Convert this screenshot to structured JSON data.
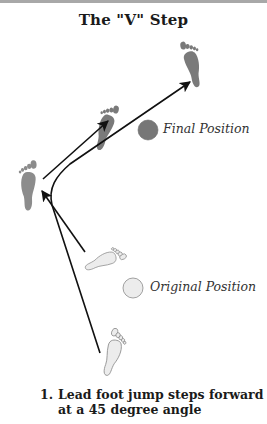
{
  "diagram": {
    "title": "The \"V\" Step",
    "legend": [
      {
        "label": "Final Position",
        "fill": "#777777",
        "stroke": "#6a6a6a"
      },
      {
        "label": "Original Position",
        "fill": "#ececec",
        "stroke": "#8a8a8a"
      }
    ],
    "footprints": [
      {
        "id": "final-right-foot",
        "state": "final",
        "fill": "#7a7a7a"
      },
      {
        "id": "final-lead-foot-middle",
        "state": "final",
        "fill": "#7a7a7a"
      },
      {
        "id": "final-left-foot",
        "state": "final",
        "fill": "#8a8a8a"
      },
      {
        "id": "original-left-foot",
        "state": "original",
        "fill": "#ececec"
      },
      {
        "id": "original-right-foot",
        "state": "original",
        "fill": "#ececec"
      }
    ],
    "arrow_color": "#111111",
    "caption": {
      "number": "1.",
      "line1": "Lead foot jump steps forward",
      "line2": "at a 45 degree angle"
    }
  }
}
